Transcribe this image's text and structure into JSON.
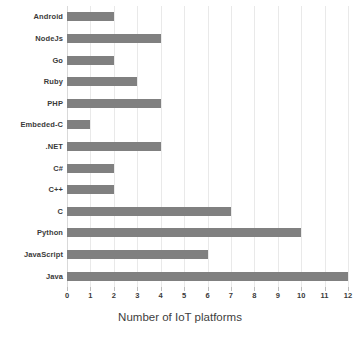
{
  "chart_data": {
    "type": "bar",
    "orientation": "horizontal",
    "title": "",
    "xlabel": "Number of IoT platforms",
    "ylabel": "",
    "categories": [
      "Android",
      "NodeJs",
      "Go",
      "Ruby",
      "PHP",
      "Embeded-C",
      ".NET",
      "C#",
      "C++",
      "C",
      "Python",
      "JavaScript",
      "Java"
    ],
    "values": [
      2,
      4,
      2,
      3,
      4,
      1,
      4,
      2,
      2,
      7,
      10,
      6,
      12
    ],
    "xlim": [
      0,
      12
    ],
    "xticks": [
      0,
      1,
      2,
      3,
      4,
      5,
      6,
      7,
      8,
      9,
      10,
      11,
      12
    ],
    "xtick_labels": [
      "0",
      "1",
      "2",
      "3",
      "4",
      "5",
      "6",
      "7",
      "8",
      "9",
      "10",
      "11",
      "12"
    ],
    "grid": true,
    "grid_axis": "x",
    "legend": false,
    "bar_color": "#808080",
    "grid_color": "#e9e9e9",
    "text_color": "#3a3a3a"
  }
}
